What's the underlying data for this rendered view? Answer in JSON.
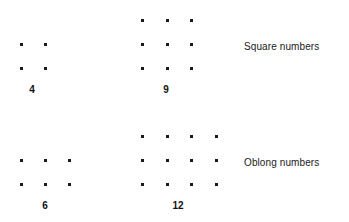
{
  "figure": {
    "background_color": "#ffffff",
    "dot_color": "#1a1a1a",
    "text_color": "#111111"
  },
  "chart_data": {
    "type": "scatter",
    "title": "",
    "subtitle": "",
    "xlabel": "",
    "ylabel": "",
    "grid": false,
    "legend_position": "right",
    "rows": [
      {
        "name": "Square numbers",
        "label": "Square numbers",
        "label_x": 244,
        "label_y": 41,
        "groups": [
          {
            "label": "4",
            "value": 4,
            "cols": 2,
            "rows": 2,
            "origin_x": 20,
            "origin_y": 43,
            "col_spacing": 24,
            "row_spacing": 24,
            "label_x": 32,
            "label_y": 84
          },
          {
            "label": "9",
            "value": 9,
            "cols": 3,
            "rows": 3,
            "origin_x": 141,
            "origin_y": 19,
            "col_spacing": 24.5,
            "row_spacing": 24,
            "label_x": 166,
            "label_y": 84
          }
        ]
      },
      {
        "name": "Oblong numbers",
        "label": "Oblong numbers",
        "label_x": 244,
        "label_y": 157,
        "groups": [
          {
            "label": "6",
            "value": 6,
            "cols": 3,
            "rows": 2,
            "origin_x": 20,
            "origin_y": 159,
            "col_spacing": 24,
            "row_spacing": 24,
            "label_x": 45,
            "label_y": 200
          },
          {
            "label": "12",
            "value": 12,
            "cols": 4,
            "rows": 3,
            "origin_x": 141,
            "origin_y": 135,
            "col_spacing": 24.5,
            "row_spacing": 24,
            "label_x": 178,
            "label_y": 200
          }
        ]
      }
    ]
  }
}
